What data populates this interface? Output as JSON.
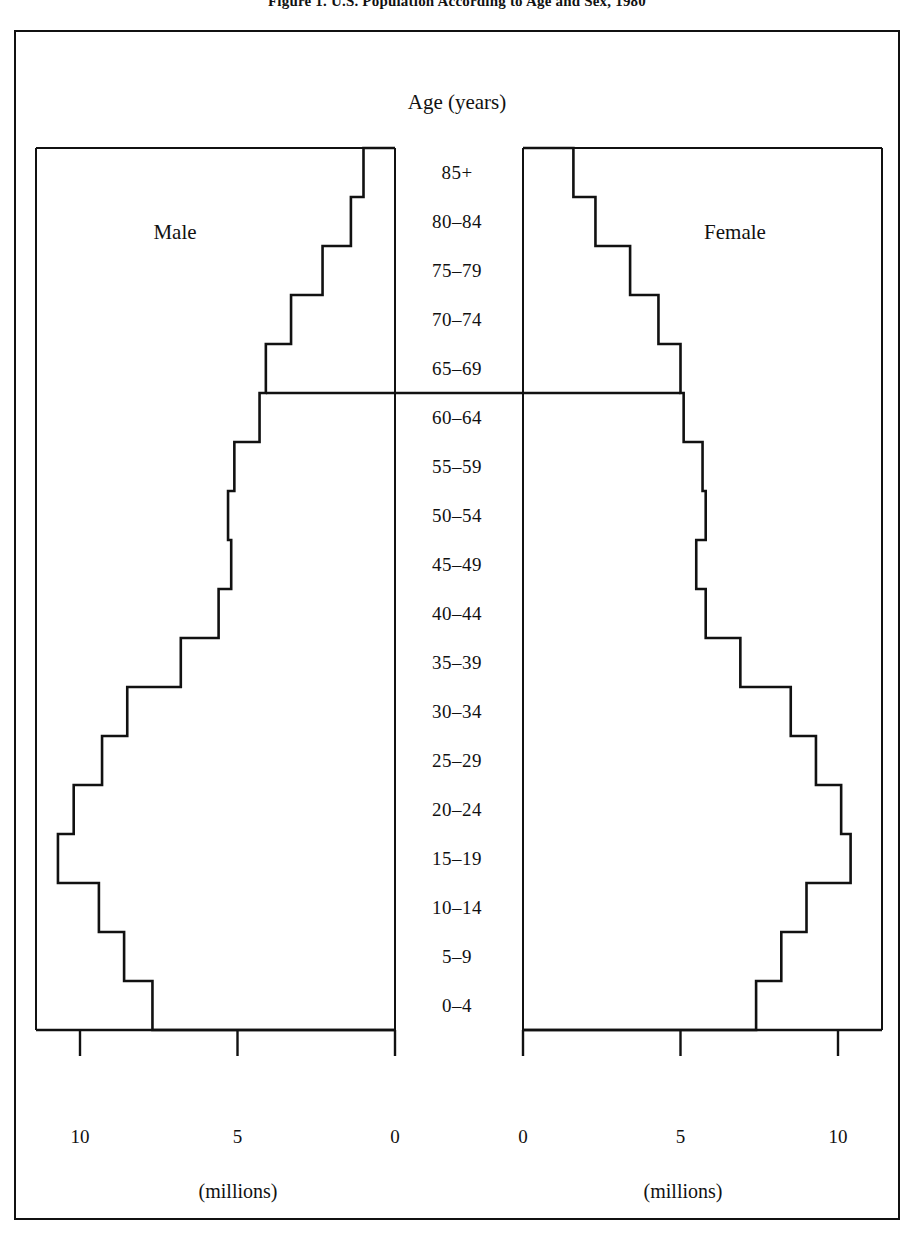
{
  "figure": {
    "title": "Figure 1. U.S. Population According to Age and Sex, 1980",
    "axis_title": "Age (years)",
    "male_label": "Male",
    "female_label": "Female",
    "unit_label_left": "(millions)",
    "unit_label_right": "(millions)",
    "ink_color": "#111111",
    "background_color": "#ffffff"
  },
  "chart_data": {
    "type": "bar",
    "title": "Figure 1. U.S. Population According to Age and Sex, 1980",
    "subtitle": "",
    "orientation": "horizontal-diverging",
    "xlabel": "(millions)",
    "ylabel": "Age (years)",
    "xlim": [
      0,
      11.8
    ],
    "grid": false,
    "legend_position": "inside-panels",
    "axis_ticks": [
      0,
      5,
      10
    ],
    "axis_tick_labels": [
      "0",
      "5",
      "10"
    ],
    "categories": [
      "85+",
      "80–84",
      "75–79",
      "70–74",
      "65–69",
      "60–64",
      "55–59",
      "50–54",
      "45–49",
      "40–44",
      "35–39",
      "30–34",
      "25–29",
      "20–24",
      "15–19",
      "10–14",
      "5–9",
      "0–4"
    ],
    "series": [
      {
        "name": "Male",
        "side": "left",
        "values": [
          1.0,
          1.4,
          2.3,
          3.3,
          4.1,
          4.3,
          5.1,
          5.3,
          5.2,
          5.6,
          6.8,
          8.5,
          9.3,
          10.2,
          10.7,
          9.4,
          8.6,
          7.7
        ]
      },
      {
        "name": "Female",
        "side": "right",
        "values": [
          1.6,
          2.3,
          3.4,
          4.3,
          5.0,
          5.1,
          5.7,
          5.8,
          5.5,
          5.8,
          6.9,
          8.5,
          9.3,
          10.1,
          10.4,
          9.0,
          8.2,
          7.4
        ]
      }
    ],
    "annotations": [
      {
        "text": "Male",
        "panel": "left"
      },
      {
        "text": "Female",
        "panel": "right"
      }
    ]
  },
  "axis_tick_labels_left": [
    "10",
    "5",
    "0"
  ],
  "axis_tick_labels_right": [
    "0",
    "5",
    "10"
  ]
}
